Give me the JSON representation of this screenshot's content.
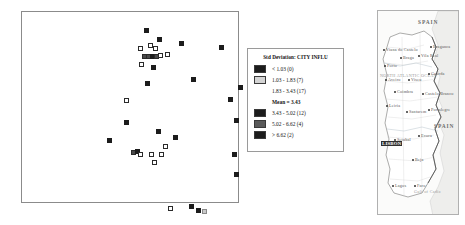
{
  "legend": {
    "title": "Std Deviation: CITY INFLU",
    "mean_label": "Mean =",
    "mean_value": "3.43",
    "rows": [
      {
        "swatch": "#1c1c1c",
        "label": "<   1.03 (0)"
      },
      {
        "swatch": "#d4d4d4",
        "label": "1.03  -   1.83 (7)"
      },
      {
        "swatch": "none",
        "label": "1.83  -   3.43 (17)"
      },
      {
        "swatch": "#1c1c1c",
        "label": "3.43  -   5.02 (12)"
      },
      {
        "swatch": "#5a5a5a",
        "label": "5.02  -   6.62 (4)"
      },
      {
        "swatch": "#1c1c1c",
        "label": ">   6.62 (2)"
      }
    ]
  },
  "map": {
    "country_right": "SPAIN",
    "country_right_lower": "SPAIN",
    "ocean": "NORTH ATLANTIC OCEAN",
    "capital": "LISBON",
    "gulf": "Gulf of Cadiz",
    "cities": [
      {
        "name": "Viana do Castelo",
        "x": 5,
        "y": 36
      },
      {
        "name": "Braga",
        "x": 22,
        "y": 44
      },
      {
        "name": "Vila Real",
        "x": 40,
        "y": 42
      },
      {
        "name": "Porto",
        "x": 6,
        "y": 52
      },
      {
        "name": "Braganca",
        "x": 52,
        "y": 33
      },
      {
        "name": "Aveiro",
        "x": 7,
        "y": 66
      },
      {
        "name": "Viseu",
        "x": 30,
        "y": 66
      },
      {
        "name": "Guarda",
        "x": 50,
        "y": 60
      },
      {
        "name": "Coimbra",
        "x": 16,
        "y": 78
      },
      {
        "name": "Castelo Branco",
        "x": 44,
        "y": 80
      },
      {
        "name": "Leiria",
        "x": 8,
        "y": 92
      },
      {
        "name": "Santarem",
        "x": 28,
        "y": 98
      },
      {
        "name": "Portalegre",
        "x": 50,
        "y": 96
      },
      {
        "name": "Setubal",
        "x": 16,
        "y": 126
      },
      {
        "name": "Evora",
        "x": 40,
        "y": 122
      },
      {
        "name": "Beja",
        "x": 34,
        "y": 146
      },
      {
        "name": "Faro",
        "x": 36,
        "y": 172
      },
      {
        "name": "Lagos",
        "x": 14,
        "y": 172
      }
    ]
  },
  "chart_data": {
    "type": "scatter",
    "title": "",
    "xlabel": "",
    "ylabel": "",
    "grid": false,
    "legend_position": "right",
    "classes": [
      {
        "name": "< 1.03",
        "count": 0,
        "color": "#1c1c1c",
        "style": "filled"
      },
      {
        "name": "1.03 - 1.83",
        "count": 7,
        "color": "#d4d4d4",
        "style": "light"
      },
      {
        "name": "1.83 - 3.43",
        "count": 17,
        "color": "#ffffff",
        "style": "hollow"
      },
      {
        "name": "3.43 - 5.02",
        "count": 12,
        "color": "#1c1c1c",
        "style": "filled"
      },
      {
        "name": "5.02 - 6.62",
        "count": 4,
        "color": "#5a5a5a",
        "style": "dark"
      },
      {
        "name": "> 6.62",
        "count": 2,
        "color": "#1c1c1c",
        "style": "filled"
      }
    ],
    "points": [
      {
        "x": 124,
        "y": 18,
        "style": "filled"
      },
      {
        "x": 137,
        "y": 27,
        "style": "filled"
      },
      {
        "x": 159,
        "y": 31,
        "style": "filled"
      },
      {
        "x": 118,
        "y": 36,
        "style": "hollow"
      },
      {
        "x": 128,
        "y": 33,
        "style": "hollow"
      },
      {
        "x": 133,
        "y": 36,
        "style": "hollow"
      },
      {
        "x": 199,
        "y": 35,
        "style": "filled"
      },
      {
        "x": 122,
        "y": 44,
        "style": "dark"
      },
      {
        "x": 126,
        "y": 44,
        "style": "dark"
      },
      {
        "x": 130,
        "y": 44,
        "style": "filled"
      },
      {
        "x": 134,
        "y": 44,
        "style": "dark"
      },
      {
        "x": 138,
        "y": 43,
        "style": "hollow"
      },
      {
        "x": 145,
        "y": 42,
        "style": "hollow"
      },
      {
        "x": 119,
        "y": 52,
        "style": "hollow"
      },
      {
        "x": 131,
        "y": 55,
        "style": "filled"
      },
      {
        "x": 125,
        "y": 71,
        "style": "filled"
      },
      {
        "x": 171,
        "y": 67,
        "style": "filled"
      },
      {
        "x": 218,
        "y": 75,
        "style": "filled"
      },
      {
        "x": 208,
        "y": 87,
        "style": "filled"
      },
      {
        "x": 104,
        "y": 88,
        "style": "hollow"
      },
      {
        "x": 214,
        "y": 108,
        "style": "filled"
      },
      {
        "x": 104,
        "y": 110,
        "style": "filled"
      },
      {
        "x": 87,
        "y": 128,
        "style": "filled"
      },
      {
        "x": 136,
        "y": 119,
        "style": "filled"
      },
      {
        "x": 153,
        "y": 125,
        "style": "filled"
      },
      {
        "x": 143,
        "y": 134,
        "style": "hollow"
      },
      {
        "x": 111,
        "y": 140,
        "style": "dark"
      },
      {
        "x": 115,
        "y": 139,
        "style": "filled"
      },
      {
        "x": 118,
        "y": 142,
        "style": "hollow"
      },
      {
        "x": 129,
        "y": 142,
        "style": "hollow"
      },
      {
        "x": 139,
        "y": 142,
        "style": "hollow"
      },
      {
        "x": 132,
        "y": 150,
        "style": "hollow"
      },
      {
        "x": 212,
        "y": 142,
        "style": "filled"
      },
      {
        "x": 214,
        "y": 162,
        "style": "filled"
      },
      {
        "x": 148,
        "y": 196,
        "style": "hollow"
      },
      {
        "x": 169,
        "y": 194,
        "style": "filled"
      },
      {
        "x": 176,
        "y": 198,
        "style": "filled"
      },
      {
        "x": 182,
        "y": 199,
        "style": "light"
      }
    ]
  }
}
